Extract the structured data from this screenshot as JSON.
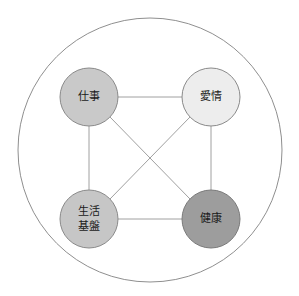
{
  "diagram": {
    "type": "node-network",
    "title": "",
    "background_color": "#ffffff",
    "outer_circle": {
      "name": "outer-boundary-circle",
      "cx": 150,
      "cy": 150,
      "r": 132,
      "fill": "#ffffff",
      "stroke": "#8f8f8f",
      "stroke_width": 1
    },
    "nodes": [
      {
        "id": "work",
        "label": "仕事",
        "lines": [
          "仕事"
        ],
        "cx": 89,
        "cy": 97,
        "r": 29,
        "fill": "#c9c9c9",
        "stroke": "#8a8a8a",
        "text_color": "#1a1a1a"
      },
      {
        "id": "love",
        "label": "愛情",
        "lines": [
          "愛情"
        ],
        "cx": 211,
        "cy": 97,
        "r": 29,
        "fill": "#ededed",
        "stroke": "#8a8a8a",
        "text_color": "#1a1a1a"
      },
      {
        "id": "life-foundation",
        "label": "生活基盤",
        "lines": [
          "生活",
          "基盤"
        ],
        "cx": 89,
        "cy": 219,
        "r": 29,
        "fill": "#c6c6c6",
        "stroke": "#8a8a8a",
        "text_color": "#1a1a1a"
      },
      {
        "id": "health",
        "label": "健康",
        "lines": [
          "健康"
        ],
        "cx": 211,
        "cy": 219,
        "r": 29,
        "fill": "#9d9d9d",
        "stroke": "#7a7a7a",
        "text_color": "#1a1a1a"
      }
    ],
    "edges": [
      {
        "id": "work-love",
        "from": "work",
        "to": "love",
        "x1": 118,
        "y1": 97,
        "x2": 182,
        "y2": 97,
        "stroke": "#a0a0a0"
      },
      {
        "id": "work-life",
        "from": "work",
        "to": "life-foundation",
        "x1": 89,
        "y1": 126,
        "x2": 89,
        "y2": 190,
        "stroke": "#a0a0a0"
      },
      {
        "id": "love-health",
        "from": "love",
        "to": "health",
        "x1": 211,
        "y1": 126,
        "x2": 211,
        "y2": 190,
        "stroke": "#a0a0a0"
      },
      {
        "id": "life-health",
        "from": "life-foundation",
        "to": "health",
        "x1": 118,
        "y1": 219,
        "x2": 182,
        "y2": 219,
        "stroke": "#a0a0a0"
      },
      {
        "id": "work-health",
        "from": "work",
        "to": "health",
        "x1": 110,
        "y1": 117,
        "x2": 190,
        "y2": 199,
        "stroke": "#a0a0a0"
      },
      {
        "id": "love-life",
        "from": "love",
        "to": "life-foundation",
        "x1": 190,
        "y1": 117,
        "x2": 110,
        "y2": 199,
        "stroke": "#a0a0a0"
      }
    ]
  }
}
